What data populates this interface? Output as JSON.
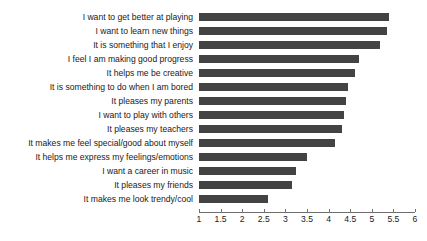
{
  "chart_data": {
    "type": "bar",
    "orientation": "horizontal",
    "title": "",
    "subtitle": "",
    "xlabel": "",
    "ylabel": "",
    "xlim": [
      1,
      6
    ],
    "xticks": [
      "1",
      "1.5",
      "2",
      "2.5",
      "3",
      "3.5",
      "4",
      "4.5",
      "5",
      "5.5",
      "6"
    ],
    "xtick_values": [
      1,
      1.5,
      2,
      2.5,
      3,
      3.5,
      4,
      4.5,
      5,
      5.5,
      6
    ],
    "grid": false,
    "legend": null,
    "bar_color": "#434343",
    "axis_color": "#6f6f6f",
    "text_color": "#1a1a1a",
    "categories": [
      "I want to get better at playing",
      "I want to learn new things",
      "It is something that I enjoy",
      "I feel I am making good progress",
      "It helps me be creative",
      "It is something to do when I am bored",
      "It pleases my parents",
      "I want to play with others",
      "It pleases my teachers",
      "It makes me feel special/good about myself",
      "It helps me express my feelings/emotions",
      "I want a career in music",
      "It pleases my friends",
      "It makes me look trendy/cool"
    ],
    "values": [
      5.4,
      5.35,
      5.2,
      4.7,
      4.6,
      4.45,
      4.4,
      4.35,
      4.3,
      4.15,
      3.5,
      3.25,
      3.15,
      2.6
    ]
  }
}
